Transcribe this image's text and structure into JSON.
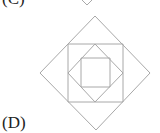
{
  "labels": {
    "previous_option": "(C)",
    "current_option": "(D)"
  },
  "figure": {
    "stroke_color": "#a8a8a8",
    "shapes": [
      {
        "name": "outer-diamond",
        "type": "diamond",
        "points": "95,16 150,73 96,130 40,73"
      },
      {
        "name": "outer-square",
        "type": "square",
        "points": "68,44 123,44 123,102 68,102"
      },
      {
        "name": "inner-diamond",
        "type": "diamond",
        "points": "95,44 123,73 95,102 68,73"
      },
      {
        "name": "inner-square",
        "type": "square",
        "points": "81,58 110,58 110,87 81,87"
      }
    ],
    "previous_figure_tip": "82,0 87,5 92,0"
  }
}
